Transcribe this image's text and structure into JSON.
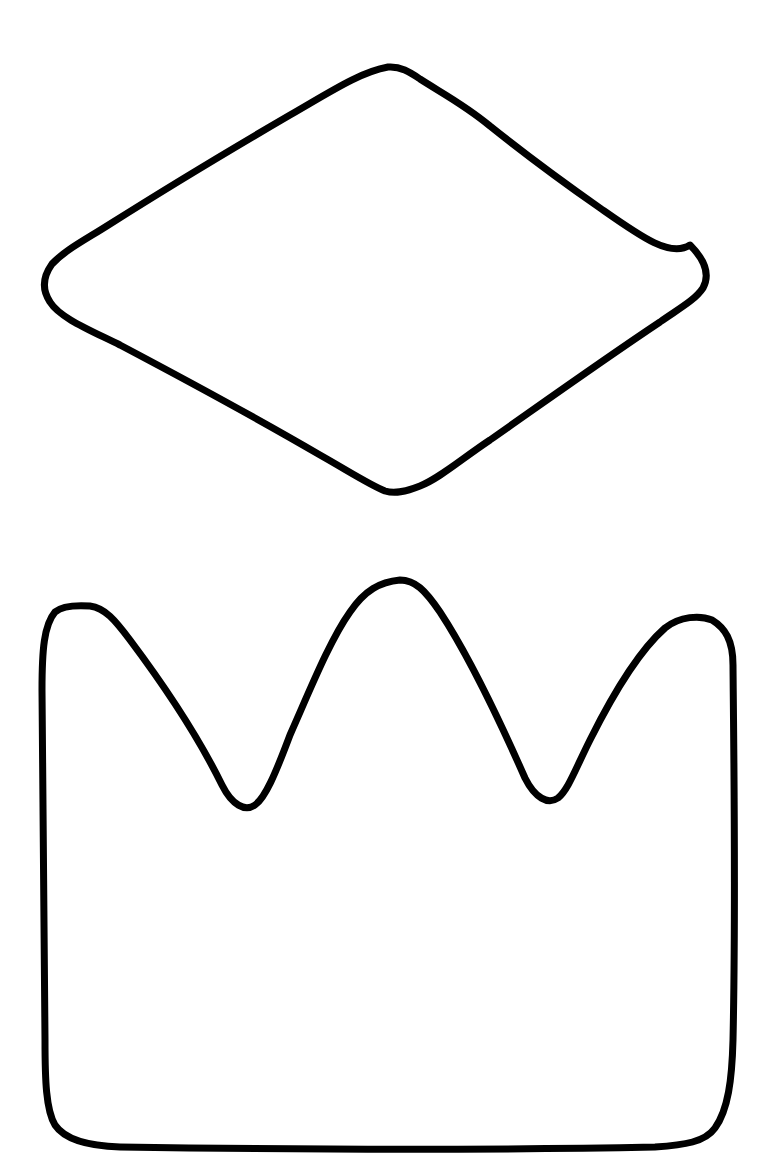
{
  "canvas": {
    "width": 781,
    "height": 1176,
    "background": "#ffffff"
  },
  "shapes": [
    {
      "name": "diamond",
      "description": "rounded diamond / gem outline",
      "stroke": "#000000"
    },
    {
      "name": "crown",
      "description": "three-pointed crown outline",
      "stroke": "#000000"
    }
  ]
}
